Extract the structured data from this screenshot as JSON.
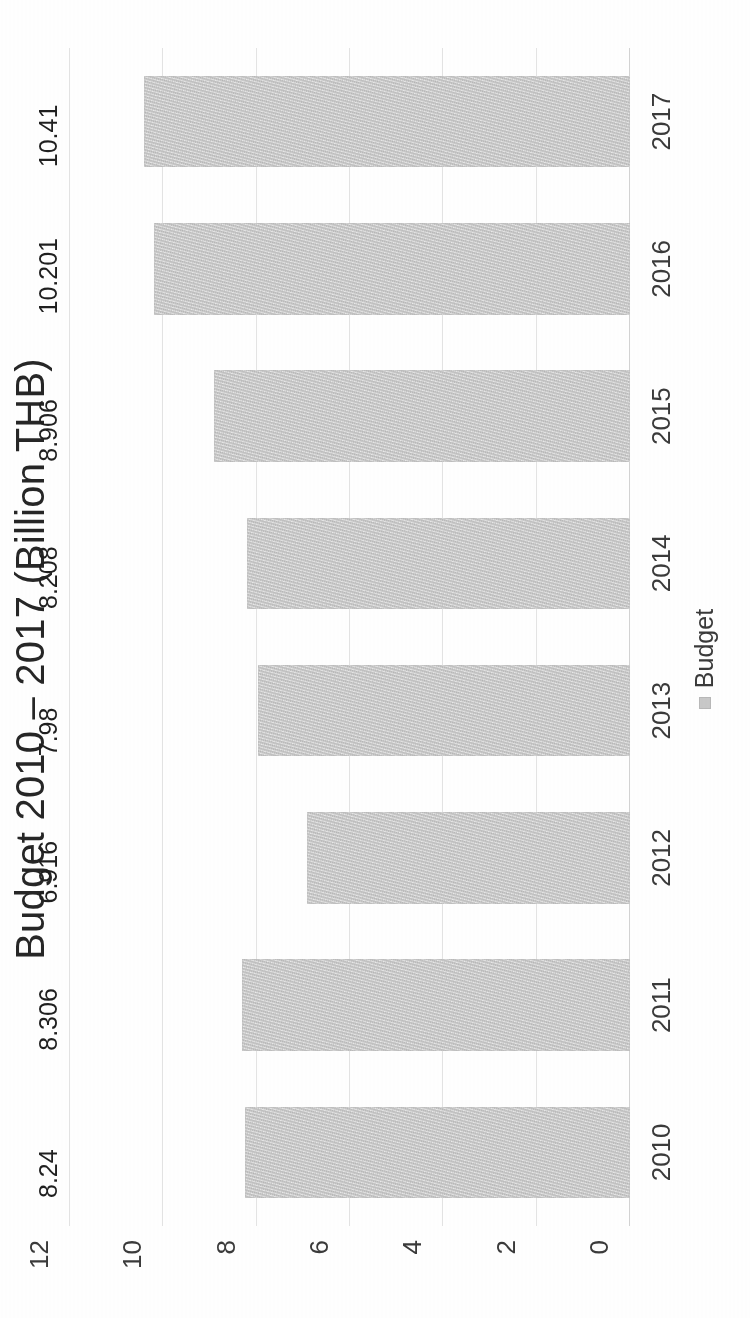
{
  "chart_data": {
    "type": "bar",
    "title": "Budget 2010 – 2017 (Billion THB)",
    "xlabel": "",
    "ylabel": "",
    "categories": [
      "2010",
      "2011",
      "2012",
      "2013",
      "2014",
      "2015",
      "2016",
      "2017"
    ],
    "values": [
      8.24,
      8.306,
      6.916,
      7.98,
      8.208,
      8.906,
      10.201,
      10.41
    ],
    "data_labels": [
      "8.24",
      "8.306",
      "6.916",
      "7.98",
      "8.208",
      "8.906",
      "10.201",
      "10.41"
    ],
    "series": [
      {
        "name": "Budget",
        "values": [
          8.24,
          8.306,
          6.916,
          7.98,
          8.208,
          8.906,
          10.201,
          10.41
        ],
        "color": "#c9c9c9"
      }
    ],
    "ylim": [
      0,
      12
    ],
    "yticks": [
      0,
      2,
      4,
      6,
      8,
      10,
      12
    ],
    "ytick_labels": [
      "0",
      "2",
      "4",
      "6",
      "8",
      "10",
      "12"
    ],
    "grid": true,
    "grid_color": "#e4e4e4",
    "legend": {
      "position": "bottom",
      "entries": [
        {
          "label": "Budget",
          "color": "#c9c9c9"
        }
      ]
    },
    "orientation": "vertical-bars-page-rotated-90ccw",
    "bar_color": "#c9c9c9",
    "text_color": "#262626"
  }
}
